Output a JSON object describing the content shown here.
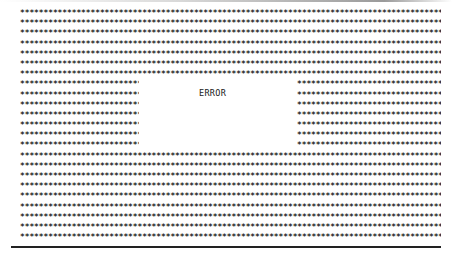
{
  "error_panel": {
    "message": "ERROR",
    "fill_char": "*",
    "rows_total": 23,
    "split_rows": [
      8,
      14
    ],
    "text_color": "#1a1a1a",
    "background": "#ffffff"
  },
  "pattern": {
    "full": "******************************************************************************************",
    "left": "****************************",
    "right": "*********************************"
  }
}
